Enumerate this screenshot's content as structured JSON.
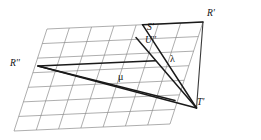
{
  "figure": {
    "type": "geometric-diagram",
    "background_color": "#ffffff",
    "grid_color": "#8b8b8b",
    "line_color": "#1a1a1a",
    "labels": [
      {
        "id": "R-prime",
        "text": "R'",
        "x": 208,
        "y": 12,
        "kind": "point"
      },
      {
        "id": "S-prime",
        "text": "S'",
        "x": 148,
        "y": 25,
        "kind": "point"
      },
      {
        "id": "U-double-prime",
        "text": "U''",
        "x": 146,
        "y": 38,
        "kind": "point"
      },
      {
        "id": "R-double-prime",
        "text": "R''",
        "x": 11,
        "y": 62,
        "kind": "point"
      },
      {
        "id": "T-prime",
        "text": "T'",
        "x": 197,
        "y": 101,
        "kind": "point"
      },
      {
        "id": "lambda",
        "text": "λ",
        "x": 171,
        "y": 58,
        "kind": "greek"
      },
      {
        "id": "mu",
        "text": "μ",
        "x": 119,
        "y": 75,
        "kind": "greek"
      }
    ],
    "grid": {
      "origin_x": 47,
      "origin_y": 29,
      "u_vector_x": 28.0,
      "u_vector_y": 13.2,
      "v_vector_x": -15.5,
      "v_vector_y": 14.6,
      "u_count": 7,
      "v_count": 7
    },
    "construction": {
      "points": {
        "R_prime": {
          "x": 203,
          "y": 22
        },
        "T_prime": {
          "x": 196,
          "y": 108
        },
        "R_double_prime": {
          "x": 38,
          "y": 66
        },
        "S_prime": {
          "x": 157,
          "y": 34
        },
        "U_double_prime": {
          "x": 152,
          "y": 47
        }
      },
      "segments": [
        {
          "id": "seg-R-prime-to-T-prime",
          "from": "R_prime",
          "to": "T_prime",
          "weight": "medium"
        },
        {
          "id": "seg-R-prime-to-left",
          "from": "R_prime",
          "to": "upper_left",
          "weight": "medium"
        },
        {
          "id": "seg-upper-left-to-T-prime",
          "from": "upper_left",
          "to": "T_prime",
          "weight": "bold"
        },
        {
          "id": "seg-R2-to-T-prime",
          "from": "R_double_prime",
          "to": "T_prime",
          "weight": "bold"
        },
        {
          "id": "seg-R2-to-right",
          "from": "R_double_prime",
          "to": "mid_right",
          "weight": "bold"
        }
      ]
    }
  }
}
